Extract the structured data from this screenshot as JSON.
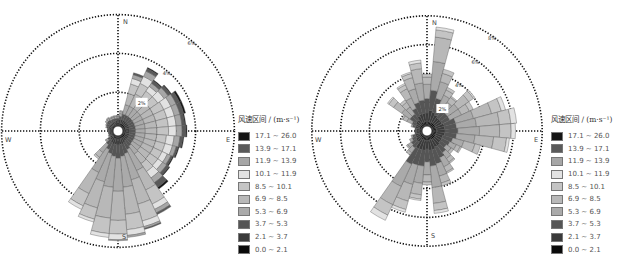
{
  "legend": {
    "title": "风速区间 / (m·s⁻¹)",
    "bins": [
      {
        "label": "17.1 ~ 26.0",
        "color": "#151515"
      },
      {
        "label": "13.9 ~ 17.1",
        "color": "#5a5a5a"
      },
      {
        "label": "11.9 ~ 13.9",
        "color": "#a6a6a6"
      },
      {
        "label": "10.1 ~ 11.9",
        "color": "#e2e2e2"
      },
      {
        "label": "8.5 ~ 10.1",
        "color": "#c4c4c4"
      },
      {
        "label": "6.9 ~ 8.5",
        "color": "#b8b8b8"
      },
      {
        "label": "5.3 ~ 6.9",
        "color": "#aaaaaa"
      },
      {
        "label": "3.7 ~ 5.3",
        "color": "#555555"
      },
      {
        "label": "2.1 ~ 3.7",
        "color": "#3a3a3a"
      },
      {
        "label": "0.0 ~ 2.1",
        "color": "#0a0a0a"
      }
    ]
  },
  "chart_data": [
    {
      "type": "wind-rose",
      "id": "left",
      "directions_labels": {
        "N": "N",
        "E": "E",
        "S": "S",
        "W": "W"
      },
      "ring_labels": [
        "2%",
        "4%",
        "6%"
      ],
      "rings_percent": [
        2,
        4,
        6
      ],
      "sector_width_deg": 10,
      "legend_title": "风速区间 / (m·s⁻¹)",
      "bins_low_to_high": [
        "0.0 ~ 2.1",
        "2.1 ~ 3.7",
        "3.7 ~ 5.3",
        "5.3 ~ 6.9",
        "6.9 ~ 8.5",
        "8.5 ~ 10.1",
        "10.1 ~ 11.9",
        "11.9 ~ 13.9",
        "13.9 ~ 17.1",
        "17.1 ~ 26.0"
      ],
      "sectors": [
        {
          "dir": 0,
          "values": [
            0.15,
            0.15,
            0.1,
            0.1,
            0.05,
            0,
            0,
            0,
            0,
            0
          ]
        },
        {
          "dir": 10,
          "values": [
            0.15,
            0.2,
            0.15,
            0.15,
            0.1,
            0.05,
            0,
            0,
            0,
            0
          ]
        },
        {
          "dir": 20,
          "values": [
            0.15,
            0.2,
            0.3,
            0.5,
            0.6,
            0.5,
            0.3,
            0.2,
            0.1,
            0
          ]
        },
        {
          "dir": 30,
          "values": [
            0.15,
            0.2,
            0.3,
            0.5,
            0.7,
            0.6,
            0.4,
            0.3,
            0.15,
            0.05
          ]
        },
        {
          "dir": 40,
          "values": [
            0.15,
            0.2,
            0.3,
            0.5,
            0.6,
            0.5,
            0.3,
            0.2,
            0.15,
            0.05
          ]
        },
        {
          "dir": 50,
          "values": [
            0.15,
            0.2,
            0.3,
            0.5,
            0.6,
            0.5,
            0.4,
            0.25,
            0.15,
            0.05
          ]
        },
        {
          "dir": 60,
          "values": [
            0.15,
            0.2,
            0.3,
            0.5,
            0.6,
            0.6,
            0.4,
            0.3,
            0.2,
            0.1
          ]
        },
        {
          "dir": 70,
          "values": [
            0.15,
            0.2,
            0.3,
            0.5,
            0.6,
            0.6,
            0.4,
            0.3,
            0.2,
            0.1
          ]
        },
        {
          "dir": 80,
          "values": [
            0.15,
            0.2,
            0.3,
            0.5,
            0.6,
            0.6,
            0.4,
            0.3,
            0.15,
            0.05
          ]
        },
        {
          "dir": 90,
          "values": [
            0.15,
            0.2,
            0.3,
            0.5,
            0.6,
            0.6,
            0.4,
            0.3,
            0.2,
            0.05
          ]
        },
        {
          "dir": 100,
          "values": [
            0.15,
            0.2,
            0.3,
            0.5,
            0.6,
            0.5,
            0.4,
            0.3,
            0.15,
            0.05
          ]
        },
        {
          "dir": 110,
          "values": [
            0.15,
            0.2,
            0.3,
            0.5,
            0.6,
            0.5,
            0.4,
            0.2,
            0.1,
            0.05
          ]
        },
        {
          "dir": 120,
          "values": [
            0.15,
            0.2,
            0.3,
            0.5,
            0.6,
            0.5,
            0.3,
            0.2,
            0.1,
            0.05
          ]
        },
        {
          "dir": 130,
          "values": [
            0.15,
            0.2,
            0.3,
            0.5,
            0.6,
            0.5,
            0.3,
            0.25,
            0.15,
            0.05
          ]
        },
        {
          "dir": 140,
          "values": [
            0.15,
            0.2,
            0.35,
            0.5,
            0.6,
            0.5,
            0.4,
            0.3,
            0.3,
            0.1
          ]
        },
        {
          "dir": 150,
          "values": [
            0.15,
            0.25,
            0.4,
            1.2,
            1.1,
            0.8,
            0.3,
            0.2,
            0.1,
            0
          ]
        },
        {
          "dir": 160,
          "values": [
            0.15,
            0.3,
            0.5,
            1.4,
            1.3,
            0.9,
            0.3,
            0.1,
            0.05,
            0
          ]
        },
        {
          "dir": 170,
          "values": [
            0.15,
            0.3,
            0.6,
            1.6,
            1.4,
            0.8,
            0.3,
            0.1,
            0,
            0
          ]
        },
        {
          "dir": 180,
          "values": [
            0.15,
            0.3,
            0.7,
            1.7,
            1.5,
            0.7,
            0.3,
            0.05,
            0,
            0
          ]
        },
        {
          "dir": 190,
          "values": [
            0.15,
            0.3,
            0.6,
            1.6,
            1.6,
            0.8,
            0.2,
            0,
            0,
            0
          ]
        },
        {
          "dir": 200,
          "values": [
            0.15,
            0.3,
            0.5,
            1.5,
            1.4,
            0.6,
            0.15,
            0,
            0,
            0
          ]
        },
        {
          "dir": 210,
          "values": [
            0.15,
            0.25,
            0.4,
            1.3,
            1.2,
            0.7,
            0.2,
            0,
            0,
            0
          ]
        },
        {
          "dir": 220,
          "values": [
            0.1,
            0.2,
            0.3,
            0.5,
            0.3,
            0.1,
            0,
            0,
            0,
            0
          ]
        },
        {
          "dir": 230,
          "values": [
            0.1,
            0.15,
            0.15,
            0.1,
            0.05,
            0,
            0,
            0,
            0,
            0
          ]
        },
        {
          "dir": 240,
          "values": [
            0.1,
            0.1,
            0.05,
            0.05,
            0,
            0,
            0,
            0,
            0,
            0
          ]
        },
        {
          "dir": 250,
          "values": [
            0.1,
            0.1,
            0.05,
            0,
            0,
            0,
            0,
            0,
            0,
            0
          ]
        },
        {
          "dir": 260,
          "values": [
            0.1,
            0.1,
            0.05,
            0,
            0,
            0,
            0,
            0,
            0,
            0
          ]
        },
        {
          "dir": 270,
          "values": [
            0.1,
            0.1,
            0.05,
            0,
            0,
            0,
            0,
            0,
            0,
            0
          ]
        },
        {
          "dir": 280,
          "values": [
            0.1,
            0.1,
            0.1,
            0,
            0,
            0,
            0,
            0,
            0,
            0
          ]
        },
        {
          "dir": 290,
          "values": [
            0.1,
            0.15,
            0.1,
            0.05,
            0,
            0,
            0,
            0,
            0,
            0
          ]
        },
        {
          "dir": 300,
          "values": [
            0.1,
            0.15,
            0.15,
            0.05,
            0,
            0,
            0,
            0,
            0,
            0
          ]
        },
        {
          "dir": 310,
          "values": [
            0.1,
            0.15,
            0.2,
            0.1,
            0,
            0,
            0,
            0,
            0,
            0
          ]
        },
        {
          "dir": 320,
          "values": [
            0.1,
            0.15,
            0.2,
            0.1,
            0.05,
            0,
            0,
            0,
            0,
            0
          ]
        },
        {
          "dir": 330,
          "values": [
            0.1,
            0.15,
            0.15,
            0.1,
            0.05,
            0,
            0,
            0,
            0,
            0
          ]
        },
        {
          "dir": 340,
          "values": [
            0.1,
            0.15,
            0.15,
            0.1,
            0.05,
            0,
            0,
            0,
            0,
            0
          ]
        },
        {
          "dir": 350,
          "values": [
            0.15,
            0.15,
            0.1,
            0.1,
            0.05,
            0,
            0,
            0,
            0,
            0
          ]
        }
      ]
    },
    {
      "type": "wind-rose",
      "id": "right",
      "directions_labels": {
        "N": "N",
        "E": "E",
        "S": "S",
        "W": "W"
      },
      "ring_labels": [
        "2%",
        "4%",
        "6%",
        "8%"
      ],
      "rings_percent": [
        2,
        4,
        6,
        8
      ],
      "sector_width_deg": 10,
      "legend_title": "风速区间 / (m·s⁻¹)",
      "bins_low_to_high": [
        "0.0 ~ 2.1",
        "2.1 ~ 3.7",
        "3.7 ~ 5.3",
        "5.3 ~ 6.9",
        "6.9 ~ 8.5",
        "8.5 ~ 10.1",
        "10.1 ~ 11.9",
        "11.9 ~ 13.9",
        "13.9 ~ 17.1",
        "17.1 ~ 26.0"
      ],
      "sectors": [
        {
          "dir": 0,
          "values": [
            0.3,
            0.6,
            1.0,
            1.0,
            0.5,
            0.2,
            0,
            0,
            0,
            0
          ]
        },
        {
          "dir": 10,
          "values": [
            0.3,
            0.8,
            1.4,
            2.0,
            1.7,
            0.5,
            0.2,
            0,
            0,
            0
          ]
        },
        {
          "dir": 20,
          "values": [
            0.3,
            0.7,
            1.0,
            1.2,
            0.6,
            0.3,
            0,
            0,
            0,
            0
          ]
        },
        {
          "dir": 30,
          "values": [
            0.3,
            0.6,
            0.7,
            0.8,
            0.4,
            0.2,
            0,
            0,
            0,
            0
          ]
        },
        {
          "dir": 40,
          "values": [
            0.3,
            0.5,
            0.6,
            0.7,
            0.4,
            0.1,
            0,
            0,
            0,
            0
          ]
        },
        {
          "dir": 50,
          "values": [
            0.3,
            0.5,
            0.6,
            0.9,
            0.9,
            0.4,
            0.1,
            0,
            0,
            0
          ]
        },
        {
          "dir": 60,
          "values": [
            0.3,
            0.5,
            0.6,
            0.9,
            0.6,
            0.3,
            0,
            0,
            0,
            0
          ]
        },
        {
          "dir": 70,
          "values": [
            0.3,
            0.6,
            0.8,
            1.3,
            1.3,
            0.7,
            0.3,
            0,
            0,
            0
          ]
        },
        {
          "dir": 80,
          "values": [
            0.3,
            0.6,
            0.8,
            1.4,
            1.6,
            0.8,
            0.4,
            0,
            0,
            0
          ]
        },
        {
          "dir": 90,
          "values": [
            0.3,
            0.6,
            0.9,
            1.5,
            1.4,
            0.8,
            0.3,
            0,
            0,
            0
          ]
        },
        {
          "dir": 100,
          "values": [
            0.3,
            0.6,
            0.8,
            1.3,
            1.3,
            0.9,
            0.2,
            0,
            0,
            0
          ]
        },
        {
          "dir": 110,
          "values": [
            0.3,
            0.5,
            0.7,
            0.8,
            0.8,
            0.4,
            0,
            0,
            0,
            0
          ]
        },
        {
          "dir": 120,
          "values": [
            0.3,
            0.5,
            0.6,
            0.5,
            0.3,
            0.1,
            0,
            0,
            0,
            0
          ]
        },
        {
          "dir": 130,
          "values": [
            0.3,
            0.5,
            0.5,
            0.4,
            0.2,
            0,
            0,
            0,
            0,
            0
          ]
        },
        {
          "dir": 140,
          "values": [
            0.3,
            0.6,
            0.6,
            0.5,
            0.3,
            0.1,
            0,
            0,
            0,
            0
          ]
        },
        {
          "dir": 150,
          "values": [
            0.3,
            0.6,
            0.8,
            0.7,
            0.4,
            0.1,
            0,
            0,
            0,
            0
          ]
        },
        {
          "dir": 160,
          "values": [
            0.3,
            0.7,
            1.0,
            0.9,
            0.5,
            0.2,
            0,
            0,
            0,
            0
          ]
        },
        {
          "dir": 170,
          "values": [
            0.3,
            0.7,
            1.1,
            1.5,
            1.1,
            0.5,
            0.2,
            0,
            0,
            0
          ]
        },
        {
          "dir": 180,
          "values": [
            0.3,
            0.6,
            0.9,
            0.9,
            0.5,
            0.2,
            0,
            0,
            0,
            0
          ]
        },
        {
          "dir": 190,
          "values": [
            0.3,
            0.7,
            1.1,
            1.2,
            0.8,
            0.3,
            0.1,
            0,
            0,
            0
          ]
        },
        {
          "dir": 200,
          "values": [
            0.3,
            0.7,
            1.1,
            1.4,
            1.2,
            0.6,
            0.2,
            0,
            0,
            0
          ]
        },
        {
          "dir": 210,
          "values": [
            0.3,
            0.7,
            1.2,
            1.7,
            1.4,
            0.8,
            0.4,
            0,
            0,
            0
          ]
        },
        {
          "dir": 220,
          "values": [
            0.2,
            0.4,
            0.5,
            0.4,
            0.2,
            0,
            0,
            0,
            0,
            0
          ]
        },
        {
          "dir": 230,
          "values": [
            0.2,
            0.4,
            0.4,
            0.3,
            0.1,
            0,
            0,
            0,
            0,
            0
          ]
        },
        {
          "dir": 240,
          "values": [
            0.2,
            0.3,
            0.3,
            0.2,
            0,
            0,
            0,
            0,
            0,
            0
          ]
        },
        {
          "dir": 250,
          "values": [
            0.2,
            0.3,
            0.2,
            0.1,
            0,
            0,
            0,
            0,
            0,
            0
          ]
        },
        {
          "dir": 260,
          "values": [
            0.2,
            0.2,
            0.1,
            0,
            0,
            0,
            0,
            0,
            0,
            0
          ]
        },
        {
          "dir": 270,
          "values": [
            0.2,
            0.2,
            0.1,
            0,
            0,
            0,
            0,
            0,
            0,
            0
          ]
        },
        {
          "dir": 280,
          "values": [
            0.2,
            0.2,
            0.1,
            0,
            0,
            0,
            0,
            0,
            0,
            0
          ]
        },
        {
          "dir": 290,
          "values": [
            0.2,
            0.3,
            0.2,
            0.1,
            0,
            0,
            0,
            0,
            0,
            0
          ]
        },
        {
          "dir": 300,
          "values": [
            0.2,
            0.3,
            0.3,
            0.4,
            0.3,
            0.1,
            0,
            0,
            0,
            0
          ]
        },
        {
          "dir": 310,
          "values": [
            0.2,
            0.4,
            0.5,
            0.7,
            0.7,
            0.4,
            0.1,
            0,
            0,
            0
          ]
        },
        {
          "dir": 320,
          "values": [
            0.2,
            0.4,
            0.5,
            0.6,
            0.4,
            0.2,
            0,
            0,
            0,
            0
          ]
        },
        {
          "dir": 330,
          "values": [
            0.3,
            0.5,
            0.6,
            0.8,
            0.7,
            0.3,
            0.1,
            0,
            0,
            0
          ]
        },
        {
          "dir": 340,
          "values": [
            0.3,
            0.6,
            0.8,
            1.0,
            0.8,
            0.3,
            0.1,
            0,
            0,
            0
          ]
        },
        {
          "dir": 350,
          "values": [
            0.3,
            0.6,
            0.9,
            1.2,
            1.0,
            0.4,
            0.2,
            0,
            0,
            0
          ]
        }
      ]
    }
  ],
  "layout": {
    "left": {
      "cx": 118,
      "cy": 131,
      "px_per_percent": 19.4,
      "outer_r": 116,
      "hole_r": 5,
      "label_angle_deg": 40
    },
    "right": {
      "cx": 117,
      "cy": 131,
      "px_per_percent": 14.4,
      "outer_r": 115,
      "hole_r": 5,
      "label_angle_deg": 35
    }
  }
}
